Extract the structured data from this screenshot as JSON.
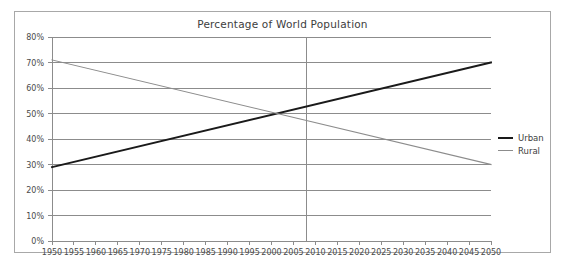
{
  "chart_data": {
    "type": "line",
    "title": "Percentage of World Population",
    "xlabel": "",
    "ylabel": "",
    "xlim": [
      1950,
      2050
    ],
    "ylim": [
      0,
      80
    ],
    "grid": true,
    "legend_position": "right",
    "x": [
      1950,
      2050
    ],
    "x_tick_labels": [
      "1950",
      "1955",
      "1960",
      "1965",
      "1970",
      "1975",
      "1980",
      "1985",
      "1990",
      "1995",
      "2000",
      "2005",
      "2010",
      "2015",
      "2020",
      "2025",
      "2030",
      "2035",
      "2040",
      "2045",
      "2050"
    ],
    "y_tick_labels": [
      "0%",
      "10%",
      "20%",
      "30%",
      "40%",
      "50%",
      "60%",
      "70%",
      "80%"
    ],
    "y_tick_values": [
      0,
      10,
      20,
      30,
      40,
      50,
      60,
      70,
      80
    ],
    "annotations": [
      {
        "name": "crossover-marker",
        "type": "vertical-line",
        "x": 2008,
        "label": ""
      }
    ],
    "series": [
      {
        "name": "Urban",
        "color": "#1a1a1a",
        "width": 1.9,
        "points": [
          [
            1950,
            29
          ],
          [
            2050,
            70
          ]
        ]
      },
      {
        "name": "Rural",
        "color": "#8c8c8c",
        "width": 1.1,
        "points": [
          [
            1950,
            71
          ],
          [
            2050,
            30
          ]
        ]
      }
    ]
  },
  "colors": {
    "frame_border": "#a8a8a8",
    "gridline": "#8c8c8c",
    "axis": "#8c8c8c",
    "text": "#3d3d3d"
  }
}
